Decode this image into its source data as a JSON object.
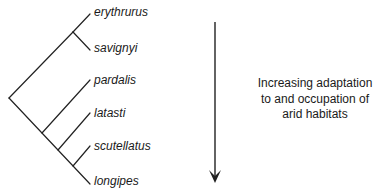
{
  "diagram": {
    "type": "phylogenetic-tree",
    "taxa": [
      {
        "name": "erythrurus",
        "tip": [
          90,
          14
        ],
        "label_pos": [
          94,
          5
        ]
      },
      {
        "name": "savignyi",
        "tip": [
          90,
          50
        ],
        "label_pos": [
          94,
          41
        ]
      },
      {
        "name": "pardalis",
        "tip": [
          90,
          80
        ],
        "label_pos": [
          94,
          73
        ]
      },
      {
        "name": "latasti",
        "tip": [
          90,
          113
        ],
        "label_pos": [
          94,
          106
        ]
      },
      {
        "name": "scutellatus",
        "tip": [
          90,
          142
        ],
        "label_pos": [
          94,
          139
        ]
      },
      {
        "name": "longipes",
        "tip": [
          90,
          184
        ],
        "label_pos": [
          94,
          174
        ]
      }
    ],
    "caption_lines": [
      "Increasing adaptation",
      "to and occupation of",
      "arid habitats"
    ],
    "arrow": {
      "direction": "down",
      "x": 215,
      "y_start": 22,
      "y_end": 183
    },
    "line_color": "#222222"
  }
}
